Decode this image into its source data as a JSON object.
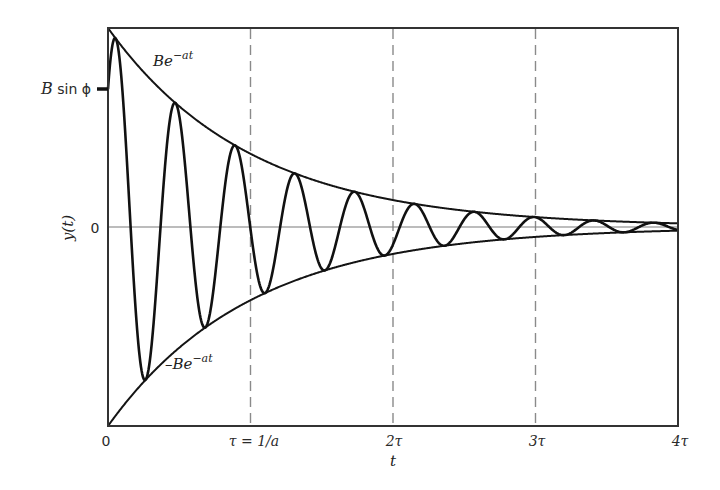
{
  "chart_data": {
    "type": "line",
    "title": "",
    "xlabel": "t",
    "ylabel": "y(t)",
    "xlim": [
      0,
      4
    ],
    "ylim": [
      -1,
      1
    ],
    "x_unit": "tau",
    "grid": false,
    "legend": null,
    "x_ticks": [
      {
        "value": 0,
        "label": "0"
      },
      {
        "value": 1,
        "label": "τ = 1/a"
      },
      {
        "value": 2,
        "label": "2τ"
      },
      {
        "value": 3,
        "label": "3τ"
      },
      {
        "value": 4,
        "label": "4τ"
      }
    ],
    "y_ticks": [
      {
        "value": 0.69,
        "label": "B sin ϕ"
      },
      {
        "value": 0,
        "label": "0"
      }
    ],
    "vertical_dashed_lines_at": [
      1,
      2,
      3
    ],
    "horizontal_reference_line_at": 0,
    "series": [
      {
        "name": "y(t) = B e^(-at) sin(ωt + ϕ)",
        "kind": "damped_sinusoid",
        "amplitude_B": 1.0,
        "decay_rate_a": 1.0,
        "omega_rad_per_tau": 14.97,
        "phase_phi_rad": 0.766,
        "initial_value": 0.69,
        "peaks_at_t": [
          0.06,
          0.48,
          0.89,
          1.31,
          1.73,
          2.15,
          2.57,
          2.99,
          3.41,
          3.83
        ],
        "troughs_at_t": [
          0.27,
          0.69,
          1.1,
          1.52,
          1.94,
          2.36,
          2.78,
          3.2,
          3.62
        ]
      },
      {
        "name": "Be^-at",
        "kind": "upper_envelope",
        "values_at_ticks": {
          "t": [
            0,
            1,
            2,
            3,
            4
          ],
          "y": [
            1.0,
            0.368,
            0.135,
            0.05,
            0.018
          ]
        }
      },
      {
        "name": "-Be^-at",
        "kind": "lower_envelope",
        "values_at_ticks": {
          "t": [
            0,
            1,
            2,
            3,
            4
          ],
          "y": [
            -1.0,
            -0.368,
            -0.135,
            -0.05,
            -0.018
          ]
        }
      }
    ],
    "annotations": [
      {
        "text": "Be^-at",
        "base": "Be",
        "exp": "−at",
        "at": [
          0.32,
          0.81
        ]
      },
      {
        "text": "-Be^-at",
        "base": "–Be",
        "exp": "−at",
        "at": [
          0.4,
          -0.71
        ]
      }
    ]
  },
  "labels": {
    "y_axis": "y(t)",
    "x_axis": "t",
    "zero": "0",
    "b_sin_phi_B": "B",
    "b_sin_phi_rest": " sin ϕ",
    "x_tick_0": "0",
    "x_tick_1": "τ = 1/a",
    "x_tick_2": "2τ",
    "x_tick_3": "3τ",
    "x_tick_4": "4τ",
    "upper_env_base": "Be",
    "upper_env_exp": "−at",
    "lower_env_base": "–Be",
    "lower_env_exp": "−at"
  },
  "colors": {
    "signal": "#111111",
    "envelope": "#141414",
    "frame": "#333333",
    "zero_line": "#7a7a7a",
    "dashed": "#8a8a8a",
    "background": "#ffffff"
  }
}
